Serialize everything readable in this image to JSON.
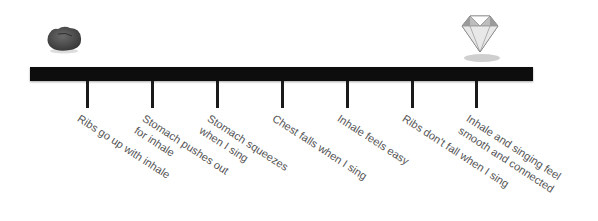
{
  "start_icon": "rock-icon",
  "end_icon": "diamond-icon",
  "colors": {
    "bar": "#0d0d0d",
    "text": "#555555"
  },
  "milestones": [
    {
      "lines": [
        "Ribs go up with inhale"
      ],
      "x": 87
    },
    {
      "lines": [
        "Stomach pushes out",
        "for inhale"
      ],
      "x": 152
    },
    {
      "lines": [
        "Stomach squeezes",
        "when I sing"
      ],
      "x": 217
    },
    {
      "lines": [
        "Chest falls when I sing"
      ],
      "x": 282
    },
    {
      "lines": [
        "Inhale feels easy"
      ],
      "x": 347
    },
    {
      "lines": [
        "Ribs don't fall when I sing"
      ],
      "x": 412
    },
    {
      "lines": [
        "Inhale and singing feel",
        "smooth and connected"
      ],
      "x": 476
    }
  ]
}
